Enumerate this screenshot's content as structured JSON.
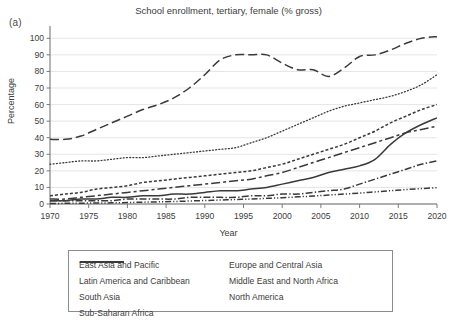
{
  "figure": {
    "panel_label": "(a)",
    "title": "School enrollment, tertiary, female (% gross)"
  },
  "axes": {
    "xlabel": "Year",
    "ylabel": "Percentage"
  },
  "legend": {
    "items": [
      {
        "label": "East Asia and Pacific",
        "style": "solid",
        "column": "left"
      },
      {
        "label": "Europe and Central Asia",
        "style": "dotted",
        "column": "right"
      },
      {
        "label": "Latin America and Caribbean",
        "style": "dashed",
        "column": "left"
      },
      {
        "label": "Middle East and North Africa",
        "style": "long-dash-gap",
        "column": "right"
      },
      {
        "label": "South Asia",
        "style": "dash-dot",
        "column": "left"
      },
      {
        "label": "North America",
        "style": "long-dash",
        "column": "right"
      },
      {
        "label": "Sub-Saharan Africa",
        "style": "dash-dot-dot",
        "column": "left"
      }
    ]
  },
  "chart_data": {
    "type": "line",
    "title": "School enrollment, tertiary, female (% gross)",
    "xlabel": "Year",
    "ylabel": "Percentage",
    "xlim": [
      1970,
      2020
    ],
    "ylim": [
      0,
      105
    ],
    "xticks": [
      1970,
      1975,
      1980,
      1985,
      1990,
      1995,
      2000,
      2005,
      2010,
      2015,
      2020
    ],
    "yticks": [
      0,
      10,
      20,
      30,
      40,
      50,
      60,
      70,
      80,
      90,
      100
    ],
    "grid": "horizontal",
    "legend_position": "below-axes",
    "x": [
      1970,
      1972,
      1974,
      1976,
      1978,
      1980,
      1982,
      1984,
      1986,
      1988,
      1990,
      1992,
      1994,
      1996,
      1998,
      2000,
      2002,
      2004,
      2006,
      2008,
      2010,
      2012,
      2014,
      2016,
      2018,
      2020
    ],
    "series": [
      {
        "name": "North America",
        "style": "long-dash",
        "values": [
          39,
          39,
          41,
          45,
          49,
          53,
          57,
          60,
          64,
          70,
          78,
          87,
          90,
          90,
          90,
          85,
          81,
          81,
          77,
          82,
          89,
          90,
          93,
          97,
          100,
          101
        ]
      },
      {
        "name": "Europe and Central Asia",
        "style": "dotted",
        "values": [
          24,
          25,
          26,
          26,
          27,
          28,
          28,
          29,
          30,
          31,
          32,
          33,
          34,
          37,
          40,
          44,
          48,
          52,
          56,
          59,
          61,
          63,
          65,
          68,
          72,
          78
        ]
      },
      {
        "name": "Latin America and Caribbean",
        "style": "dashed",
        "values": [
          5,
          6,
          7,
          9,
          10,
          11,
          13,
          14,
          15,
          16,
          17,
          18,
          19,
          20,
          22,
          24,
          27,
          30,
          33,
          36,
          40,
          44,
          49,
          53,
          57,
          60
        ]
      },
      {
        "name": "East Asia and Pacific",
        "style": "solid",
        "values": [
          2,
          2,
          3,
          3,
          4,
          4,
          5,
          5,
          6,
          6,
          7,
          8,
          8,
          9,
          10,
          12,
          14,
          16,
          19,
          21,
          23,
          27,
          36,
          43,
          48,
          52
        ]
      },
      {
        "name": "Middle East and North Africa",
        "style": "long-dash-gap",
        "values": [
          3,
          3,
          4,
          5,
          6,
          7,
          8,
          9,
          10,
          11,
          12,
          13,
          14,
          15,
          17,
          19,
          22,
          25,
          28,
          31,
          34,
          37,
          40,
          43,
          45,
          47
        ]
      },
      {
        "name": "South Asia",
        "style": "dash-dot",
        "values": [
          2,
          2,
          2,
          2,
          2,
          3,
          3,
          3,
          3,
          4,
          4,
          4,
          4,
          5,
          5,
          6,
          6,
          7,
          8,
          9,
          12,
          15,
          18,
          21,
          24,
          26
        ]
      },
      {
        "name": "Sub-Saharan Africa",
        "style": "dash-dot-dot",
        "values": [
          0.3,
          0.4,
          0.5,
          0.6,
          0.7,
          0.9,
          1.1,
          1.3,
          1.5,
          1.8,
          2.1,
          2.4,
          2.7,
          3.0,
          3.4,
          3.8,
          4.3,
          4.8,
          5.4,
          6.0,
          6.6,
          7.3,
          8.0,
          8.7,
          9.3,
          9.8
        ]
      }
    ]
  },
  "colors": {
    "line": "#3a3a3a",
    "grid": "#e2e2e6",
    "axis": "#6d6d6d",
    "text": "#3d3d3d"
  }
}
